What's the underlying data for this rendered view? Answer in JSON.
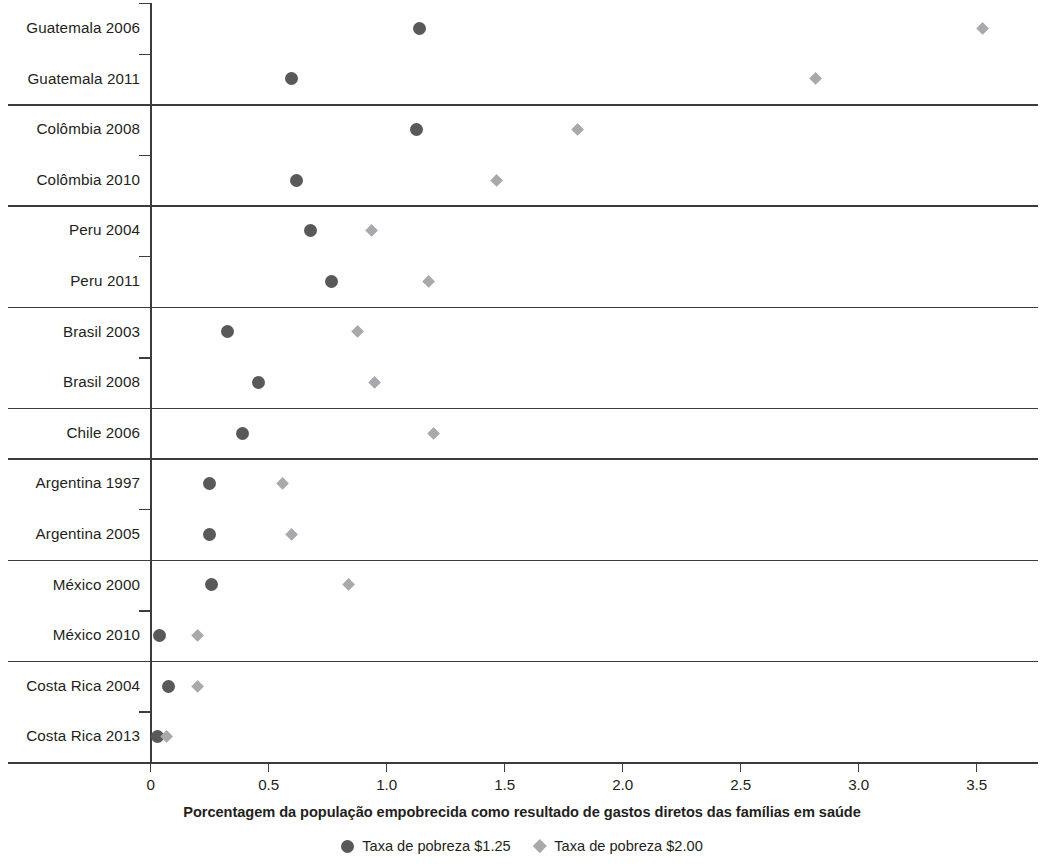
{
  "chart_data": {
    "type": "scatter",
    "title": "",
    "xlabel": "Porcentagem da população empobrecida como resultado de gastos diretos das famílias em saúde",
    "ylabel": "",
    "xlim": [
      0,
      3.7
    ],
    "xticks": [
      0,
      0.5,
      1.0,
      1.5,
      2.0,
      2.5,
      3.0,
      3.5
    ],
    "xtick_labels": [
      "0",
      "0.5",
      "1.0",
      "1.5",
      "2.0",
      "2.5",
      "3.0",
      "3.5"
    ],
    "grid": false,
    "legend_position": "bottom",
    "series": [
      {
        "name": "Taxa de pobreza $1.25",
        "marker": "circle",
        "color": "#595959",
        "values": [
          1.14,
          0.6,
          1.13,
          0.62,
          0.68,
          0.77,
          0.33,
          0.46,
          0.39,
          0.25,
          0.25,
          0.26,
          0.04,
          0.08,
          0.03
        ]
      },
      {
        "name": "Taxa de pobreza $2.00",
        "marker": "diamond",
        "color": "#a7a9ac",
        "values": [
          3.53,
          2.82,
          1.81,
          1.47,
          0.94,
          1.18,
          0.88,
          0.95,
          1.2,
          0.56,
          0.6,
          0.84,
          0.2,
          0.2,
          0.07
        ]
      }
    ],
    "categories": [
      "Guatemala 2006",
      "Guatemala 2011",
      "Colômbia 2008",
      "Colômbia 2010",
      "Peru 2004",
      "Peru 2011",
      "Brasil 2003",
      "Brasil 2008",
      "Chile 2006",
      "Argentina 1997",
      "Argentina 2005",
      "México 2000",
      "México 2010",
      "Costa Rica 2004",
      "Costa Rica 2013"
    ],
    "groups": [
      {
        "country": "Guatemala",
        "rows": [
          0,
          1
        ]
      },
      {
        "country": "Colômbia",
        "rows": [
          2,
          3
        ]
      },
      {
        "country": "Peru",
        "rows": [
          4,
          5
        ]
      },
      {
        "country": "Brasil",
        "rows": [
          6,
          7
        ]
      },
      {
        "country": "Chile",
        "rows": [
          8
        ]
      },
      {
        "country": "Argentina",
        "rows": [
          9,
          10
        ]
      },
      {
        "country": "México",
        "rows": [
          11,
          12
        ]
      },
      {
        "country": "Costa Rica",
        "rows": [
          13,
          14
        ]
      }
    ]
  },
  "legend": {
    "items": [
      {
        "label": "Taxa de pobreza $1.25",
        "marker": "circle",
        "color": "#595959"
      },
      {
        "label": "Taxa de pobreza $2.00",
        "marker": "diamond",
        "color": "#a7a9ac"
      }
    ]
  },
  "axis": {
    "x_title": "Porcentagem da população empobrecida como resultado de gastos diretos das famílias em saúde"
  },
  "colors": {
    "series_1_25": "#595959",
    "series_2_00": "#a7a9ac",
    "axis": "#3c3c3b",
    "text": "#231f20"
  }
}
